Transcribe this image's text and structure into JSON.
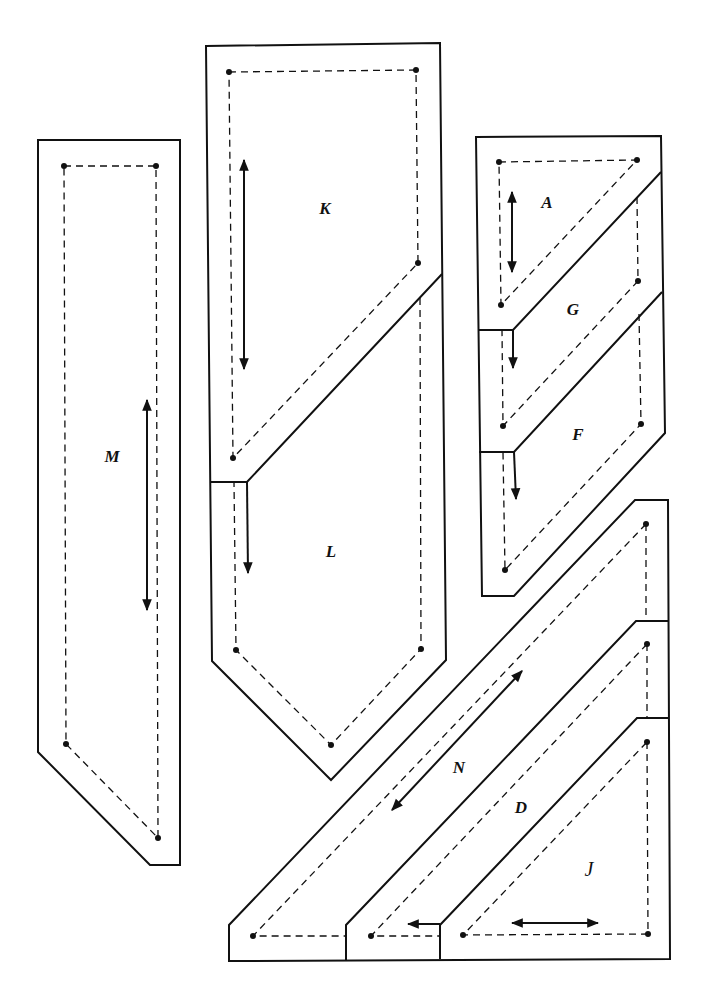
{
  "diagram": {
    "title": "",
    "pieces": {
      "M": {
        "label": "M",
        "grainline": "vertical-double"
      },
      "K": {
        "label": "K",
        "grainline": "vertical-double"
      },
      "L": {
        "label": "L",
        "grainline": "down"
      },
      "A": {
        "label": "A",
        "grainline": "vertical-double"
      },
      "G": {
        "label": "G",
        "grainline": "down"
      },
      "F": {
        "label": "F",
        "grainline": "down"
      },
      "N": {
        "label": "N",
        "grainline": "diagonal-double"
      },
      "D": {
        "label": "D",
        "grainline": "left"
      },
      "J": {
        "label": "J",
        "grainline": "horizontal-double"
      }
    },
    "legend": {
      "solid_line": "cutting line",
      "dashed_line": "seam line",
      "dot": "seam corner point",
      "arrow": "grainline"
    }
  }
}
